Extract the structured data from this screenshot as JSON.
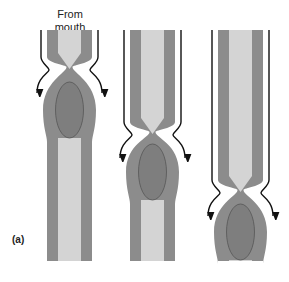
{
  "labels": {
    "from_line1": "From",
    "from_line2": "mouth",
    "panel": "(a)"
  },
  "colors": {
    "wall": "#8c8c8c",
    "lumen": "#d4d4d4",
    "bolus": "#7e7e7e",
    "line": "#111111"
  },
  "stages": [
    {
      "name": "stage-1",
      "x": 47,
      "pinch_y": 67,
      "bolus_cy": 110
    },
    {
      "name": "stage-2",
      "x": 130,
      "pinch_y": 132,
      "bolus_cy": 172
    },
    {
      "name": "stage-3",
      "x": 218,
      "pinch_y": 190,
      "bolus_cy": 232
    }
  ]
}
